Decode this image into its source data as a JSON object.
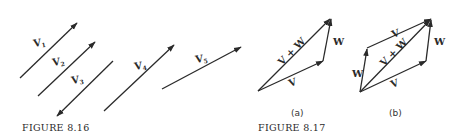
{
  "figure_816": {
    "caption": "FIGURE 8.16",
    "vectors": [
      {
        "label": "V",
        "sub": "1"
      },
      {
        "label": "V",
        "sub": "2"
      },
      {
        "label": "V",
        "sub": "3"
      },
      {
        "label": "V",
        "sub": "4"
      },
      {
        "label": "V",
        "sub": "5"
      }
    ]
  },
  "figure_817": {
    "caption": "FIGURE 8.17",
    "part_a": {
      "label": "(a)",
      "v_label": "V",
      "w_label": "W",
      "sum_label": "V + W"
    },
    "part_b": {
      "label": "(b)",
      "v_top_label": "V",
      "v_bottom_label": "V",
      "w_left_label": "W",
      "w_right_label": "W",
      "sum_label": "V + W"
    }
  }
}
